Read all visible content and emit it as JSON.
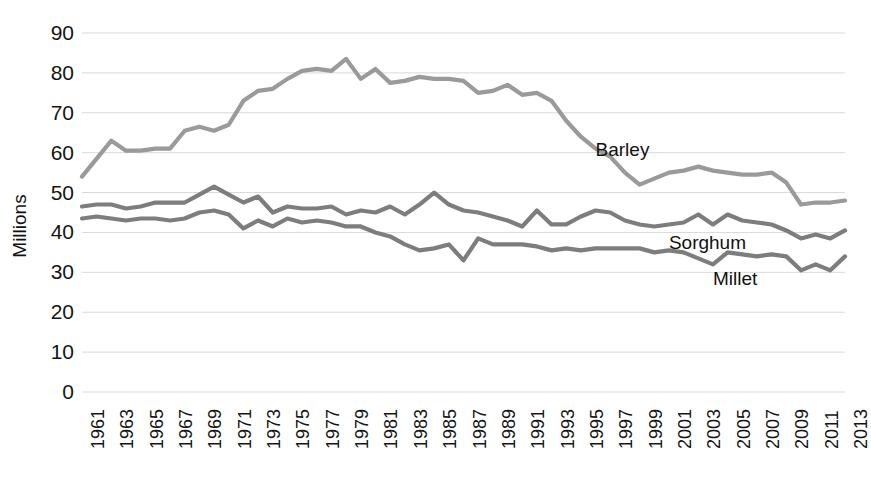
{
  "chart_data": {
    "type": "line",
    "title": "",
    "subtitle": "",
    "xlabel": "",
    "ylabel": "Millions",
    "ylim": [
      0,
      90
    ],
    "ytick_step": 10,
    "yticks": [
      90,
      80,
      70,
      60,
      50,
      40,
      30,
      20,
      10,
      0
    ],
    "grid": true,
    "grid_axis": "y",
    "legend_position": "inline-right",
    "xlim": [
      1961,
      2013
    ],
    "x": [
      1961,
      1962,
      1963,
      1964,
      1965,
      1966,
      1967,
      1968,
      1969,
      1970,
      1971,
      1972,
      1973,
      1974,
      1975,
      1976,
      1977,
      1978,
      1979,
      1980,
      1981,
      1982,
      1983,
      1984,
      1985,
      1986,
      1987,
      1988,
      1989,
      1990,
      1991,
      1992,
      1993,
      1994,
      1995,
      1996,
      1997,
      1998,
      1999,
      2000,
      2001,
      2002,
      2003,
      2004,
      2005,
      2006,
      2007,
      2008,
      2009,
      2010,
      2011,
      2012,
      2013
    ],
    "xticks": [
      1961,
      1963,
      1965,
      1967,
      1969,
      1971,
      1973,
      1975,
      1977,
      1979,
      1981,
      1983,
      1985,
      1987,
      1989,
      1991,
      1993,
      1995,
      1997,
      1999,
      2001,
      2003,
      2005,
      2007,
      2009,
      2011,
      2013
    ],
    "series": [
      {
        "name": "Barley",
        "color": "#9a9a9a",
        "label_x": 1996,
        "label_y": 60.5,
        "values": [
          54.0,
          58.5,
          63.0,
          60.5,
          60.5,
          61.0,
          61.0,
          65.5,
          66.5,
          65.5,
          67.0,
          73.0,
          75.5,
          76.0,
          78.5,
          80.5,
          81.0,
          80.5,
          83.5,
          78.5,
          81.0,
          77.5,
          78.0,
          79.0,
          78.5,
          78.5,
          78.0,
          75.0,
          75.5,
          77.0,
          74.5,
          75.0,
          73.0,
          68.0,
          64.0,
          61.0,
          59.0,
          55.0,
          52.0,
          53.5,
          55.0,
          55.5,
          56.5,
          55.5,
          55.0,
          54.5,
          54.5,
          55.0,
          52.5,
          47.0,
          47.5,
          47.5,
          48.0
        ]
      },
      {
        "name": "Sorghum",
        "color": "#7d7d7d",
        "label_x": 2001,
        "label_y": 37.0,
        "values": [
          46.5,
          47.0,
          47.0,
          46.0,
          46.5,
          47.5,
          47.5,
          47.5,
          49.5,
          51.5,
          49.5,
          47.5,
          49.0,
          45.0,
          46.5,
          46.0,
          46.0,
          46.5,
          44.5,
          45.5,
          45.0,
          46.5,
          44.5,
          47.0,
          50.0,
          47.0,
          45.5,
          45.0,
          44.0,
          43.0,
          41.5,
          45.5,
          42.0,
          42.0,
          44.0,
          45.5,
          45.0,
          43.0,
          42.0,
          41.5,
          42.0,
          42.5,
          44.5,
          42.0,
          44.5,
          43.0,
          42.5,
          42.0,
          40.5,
          38.5,
          39.5,
          38.5,
          40.5
        ]
      },
      {
        "name": "Millet",
        "color": "#7d7d7d",
        "label_x": 2004,
        "label_y": 28.0,
        "values": [
          43.5,
          44.0,
          43.5,
          43.0,
          43.5,
          43.5,
          43.0,
          43.5,
          45.0,
          45.5,
          44.5,
          41.0,
          43.0,
          41.5,
          43.5,
          42.5,
          43.0,
          42.5,
          41.5,
          41.5,
          40.0,
          39.0,
          37.0,
          35.5,
          36.0,
          37.0,
          33.0,
          38.5,
          37.0,
          37.0,
          37.0,
          36.5,
          35.5,
          36.0,
          35.5,
          36.0,
          36.0,
          36.0,
          36.0,
          35.0,
          35.5,
          35.0,
          33.5,
          32.0,
          35.0,
          34.5,
          34.0,
          34.5,
          34.0,
          30.5,
          32.0,
          30.5,
          34.0
        ]
      }
    ]
  },
  "axis": {
    "y_title": "Millions"
  }
}
